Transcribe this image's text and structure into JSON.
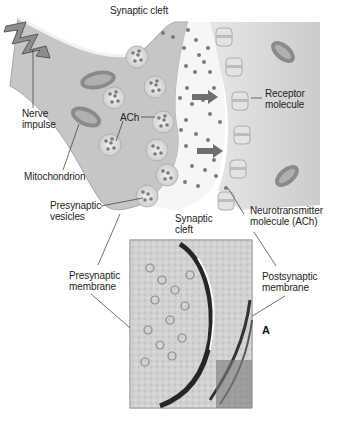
{
  "figure": {
    "panel_letter": "A",
    "labels": {
      "synaptic_cleft_top": "Synaptic cleft",
      "nerve_impulse": "Nerve\nimpulse",
      "ach": "ACh",
      "mitochondrion": "Mitochondrion",
      "presynaptic_vesicles": "Presynaptic\nvesicles",
      "synaptic_cleft_bottom": "Synaptic\ncleft",
      "receptor_molecule": "Receptor\nmolecule",
      "neurotransmitter_molecule": "Neurotransmitter\nmolecule (ACh)",
      "presynaptic_membrane": "Presynaptic\nmembrane",
      "postsynaptic_membrane": "Postsynaptic\nmembrane"
    },
    "colors": {
      "background": "#ffffff",
      "presynaptic_cell": "#c9c9c9",
      "postsynaptic_cell": "#d4d4d4",
      "cleft": "#f4f4f4",
      "vesicle": "#dedede",
      "molecule": "#7a7a7a",
      "receptor": "#e2e2e2",
      "arrow": "#6e6e6e",
      "mitochondrion": "#8a8a8a",
      "micrograph_dark": "#2a2a2a",
      "micrograph_light": "#d8d8d8"
    }
  }
}
